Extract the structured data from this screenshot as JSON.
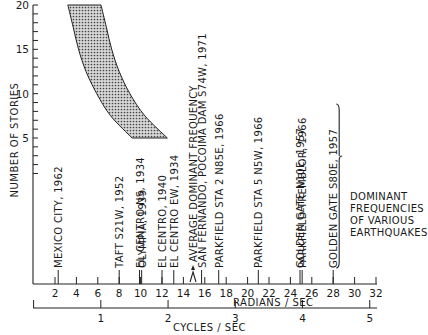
{
  "chart_data": {
    "type": "area",
    "title": "",
    "ylabel": "NUMBER OF STORIES",
    "xlabel": "RADIANS / SEC",
    "x2label": "CYCLES / SEC",
    "xlim": [
      0,
      32
    ],
    "ylim": [
      0,
      20
    ],
    "x_ticks": [
      2,
      4,
      6,
      8,
      10,
      12,
      14,
      16,
      18,
      20,
      22,
      24,
      26,
      28,
      30,
      32
    ],
    "x_tick_labels": [
      "2",
      "4",
      "6",
      "8",
      "10",
      "12",
      "14",
      "16",
      "18",
      "20",
      "22",
      "24",
      "26",
      "28",
      "30",
      "32"
    ],
    "y_ticks": [
      5,
      10,
      15,
      20
    ],
    "y_tick_labels": [
      "5",
      "10",
      "15",
      "20"
    ],
    "x2_ticks": [
      0,
      1,
      2,
      3,
      4,
      5
    ],
    "x2_tick_labels": [
      "",
      "1",
      "2",
      "3",
      "4",
      "5"
    ],
    "band": {
      "name": "Building natural frequency range",
      "stories": [
        5,
        7.5,
        10,
        12.5,
        15,
        17.5,
        20
      ],
      "low": [
        9.2,
        7.2,
        5.9,
        4.9,
        4.2,
        3.7,
        3.2
      ],
      "high": [
        12.5,
        10.4,
        9.0,
        8.0,
        7.3,
        6.8,
        6.3
      ]
    },
    "earthquakes": [
      {
        "label": "MEXICO CITY, 1962",
        "x": 2.3
      },
      {
        "label": "TAFT S21W, 1952",
        "x": 8.0
      },
      {
        "label": "EL CENTRO NS, 1934",
        "x": 9.9
      },
      {
        "label": "OLYMPIA, 1939",
        "x": 10.1
      },
      {
        "label": "EL CENTRO, 1940",
        "x": 12.0
      },
      {
        "label": "EL CENTRO EW, 1934",
        "x": 13.1
      },
      {
        "label": "AVERAGE DOMINANT FREQUENCY",
        "x": 14.9
      },
      {
        "label": "SAN FERNANDO, POCOIMA DAM S74W, 1971",
        "x": 15.7
      },
      {
        "label": "PARKFIELD STA 2 N85E, 1966",
        "x": 17.3
      },
      {
        "label": "PARKFIELD STA 5 N5W, 1966",
        "x": 21.0
      },
      {
        "label": "GOLDEN GATE N10E, 1957",
        "x": 24.9
      },
      {
        "label": "PARKFIELD-TREMBLOR, 1966",
        "x": 25.1
      },
      {
        "label": "GOLDEN GATE S80E, 1957",
        "x": 28.0
      }
    ],
    "annotation": [
      "DOMINANT",
      "FREQUENCIES",
      "OF VARIOUS",
      "EARTHQUAKES"
    ],
    "grid": false,
    "legend": "none"
  }
}
